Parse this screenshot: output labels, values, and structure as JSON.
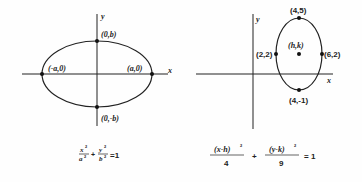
{
  "left_diagram": {
    "axis_x_label": "x",
    "axis_y_label": "y",
    "points": {
      "top": "(0,b)",
      "bottom": "(0,-b)",
      "left": "(-a,0)",
      "right": "(a,0)"
    },
    "equation": {
      "term1_num": "x",
      "term1_den": "a",
      "term2_num": "y",
      "term2_den": "b",
      "exp": "2",
      "plus": "+",
      "equals": "=1"
    }
  },
  "right_diagram": {
    "axis_x_label": "x",
    "axis_y_label": "y",
    "points": {
      "top": "(4,5)",
      "bottom": "(4,-1)",
      "left": "(2,2)",
      "right": "(6,2)",
      "center": "(h,k)"
    },
    "equation": {
      "term1_num": "(x-h)",
      "term1_den": "4",
      "term2_num": "(y-k)",
      "term2_den": "9",
      "exp": "2",
      "plus": "+",
      "equals": "= 1"
    }
  }
}
